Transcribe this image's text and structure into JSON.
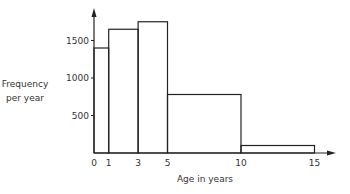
{
  "chart_data": {
    "type": "bar",
    "subtype": "histogram",
    "title": "",
    "xlabel": "Age in years",
    "ylabel": "Frequency per year",
    "ylabel_lines": [
      "Frequency",
      "per year"
    ],
    "x_ticks": [
      0,
      1,
      3,
      5,
      10,
      15
    ],
    "x_tick_labels": [
      "0",
      "1",
      "3",
      "5",
      "10",
      "15"
    ],
    "y_ticks": [
      500,
      1000,
      1500
    ],
    "y_tick_labels": [
      "500",
      "1000",
      "1500"
    ],
    "bins": [
      {
        "from": 0,
        "to": 1,
        "value": 1400
      },
      {
        "from": 1,
        "to": 3,
        "value": 1650
      },
      {
        "from": 3,
        "to": 5,
        "value": 1750
      },
      {
        "from": 5,
        "to": 10,
        "value": 780
      },
      {
        "from": 10,
        "to": 15,
        "value": 100
      }
    ],
    "categories": [
      "0-1",
      "1-3",
      "3-5",
      "5-10",
      "10-15"
    ],
    "values": [
      1400,
      1650,
      1750,
      780,
      100
    ],
    "xlim": [
      0,
      16
    ],
    "ylim": [
      0,
      1950
    ],
    "grid": false,
    "legend": null
  }
}
